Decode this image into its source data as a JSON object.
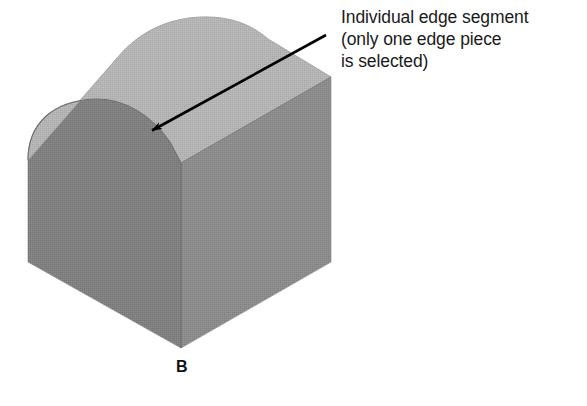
{
  "figure": {
    "label": "B",
    "annotation": {
      "lines": [
        "Individual edge segment",
        "(only one edge piece",
        "is selected)"
      ],
      "line1": "Individual edge segment",
      "line2": "(only one edge piece",
      "line3": "is selected)"
    },
    "colors": {
      "background": "#ffffff",
      "top_face": "#b5b5b5",
      "front_face": "#7f7f7f",
      "right_face": "#8b8b8b",
      "outline": "#6a6a6a",
      "arrow": "#000000",
      "text": "#1a1a1a"
    },
    "geometry": {
      "description": "Isometric rounded-corner block with one filleted vertical edge; arrow points to the single selected edge segment on the top-left boundary of the top face.",
      "arrow_start_x": 326,
      "arrow_start_y": 35,
      "arrow_tip_x": 148,
      "arrow_tip_y": 133
    }
  }
}
